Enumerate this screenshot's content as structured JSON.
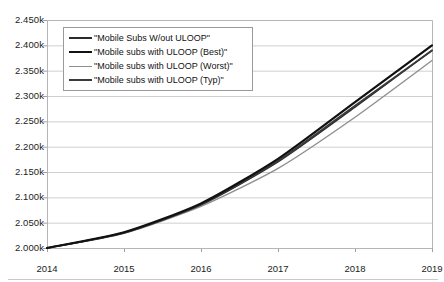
{
  "chart_data": {
    "type": "line",
    "title": "",
    "xlabel": "",
    "ylabel": "",
    "x": [
      2014,
      2015,
      2016,
      2017,
      2018,
      2019
    ],
    "categories": [
      "2014",
      "2015",
      "2016",
      "2017",
      "2018",
      "2019"
    ],
    "xlim": [
      2014,
      2019
    ],
    "ylim": [
      2000,
      2450
    ],
    "y_tick_values": [
      2000,
      2050,
      2100,
      2150,
      2200,
      2250,
      2300,
      2350,
      2400,
      2450
    ],
    "y_tick_labels": [
      "2.000k",
      "2.050k",
      "2.100k",
      "2.150k",
      "2.200k",
      "2.250k",
      "2.300k",
      "2.350k",
      "2.400k",
      "2.450k"
    ],
    "x_tick_labels": [
      "2014",
      "2015",
      "2016",
      "2017",
      "2018",
      "2019"
    ],
    "grid": true,
    "grid_axis": "y",
    "legend_position": "top-left",
    "series": [
      {
        "name": "\"Mobile Subs W/out ULOOP\"",
        "color": "#2b2b2b",
        "width": 1.5,
        "values": [
          2000,
          2030,
          2085,
          2170,
          2278,
          2390
        ]
      },
      {
        "name": "\"Mobile subs with ULOOP (Best)\"",
        "color": "#111111",
        "width": 2.2,
        "values": [
          2000,
          2031,
          2088,
          2176,
          2288,
          2400
        ]
      },
      {
        "name": "\"Mobile subs with ULOOP (Worst)\"",
        "color": "#8f8f8f",
        "width": 1.4,
        "values": [
          2000,
          2029,
          2082,
          2157,
          2258,
          2370
        ]
      },
      {
        "name": "\"Mobile subs with ULOOP (Typ)\"",
        "color": "#3a3a3a",
        "width": 1.8,
        "values": [
          2000,
          2030,
          2086,
          2172,
          2281,
          2390
        ]
      }
    ]
  },
  "axes": {
    "plot_left": 47,
    "plot_right": 432,
    "plot_top": 20,
    "plot_bottom": 248,
    "axis_color": "#b5b5b5",
    "grid_color": "#cfcfcf",
    "tick_color": "#9f9f9f"
  }
}
